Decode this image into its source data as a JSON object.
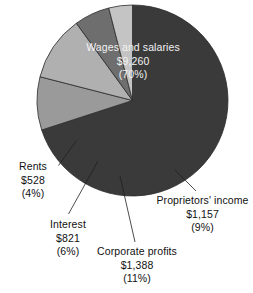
{
  "chart_data": {
    "type": "pie",
    "title": "",
    "subtitle": "",
    "xlabel": "",
    "ylabel": "",
    "legend_position": "none",
    "grid": false,
    "start_angle_deg": 0,
    "direction": "clockwise",
    "units": "billions of dollars",
    "categories": [
      "Wages and salaries",
      "Proprietors' income",
      "Corporate profits",
      "Interest",
      "Rents"
    ],
    "values": [
      9260,
      1157,
      1388,
      821,
      528
    ],
    "percentages": [
      70,
      9,
      11,
      6,
      4
    ],
    "value_labels": [
      "$9,260",
      "$1,157",
      "$1,388",
      "$821",
      "$528"
    ],
    "percent_labels": [
      "(70%)",
      "(9%)",
      "(11%)",
      "(6%)",
      "(4%)"
    ],
    "colors": [
      "#3a3a3a",
      "#9a9a9a",
      "#b0b0b0",
      "#6e6e6e",
      "#c4c4c4"
    ],
    "slices": [
      {
        "name": "Wages and salaries",
        "value": 9260,
        "value_label": "$9,260",
        "percent": 70,
        "percent_label": "(70%)",
        "color": "#3a3a3a",
        "label_placement": "inside"
      },
      {
        "name": "Proprietors' income",
        "value": 1157,
        "value_label": "$1,157",
        "percent": 9,
        "percent_label": "(9%)",
        "color": "#9a9a9a",
        "label_placement": "outside"
      },
      {
        "name": "Corporate profits",
        "value": 1388,
        "value_label": "$1,388",
        "percent": 11,
        "percent_label": "(11%)",
        "color": "#b0b0b0",
        "label_placement": "outside"
      },
      {
        "name": "Interest",
        "value": 821,
        "value_label": "$821",
        "percent": 6,
        "percent_label": "(6%)",
        "color": "#6e6e6e",
        "label_placement": "outside"
      },
      {
        "name": "Rents",
        "value": 528,
        "value_label": "$528",
        "percent": 4,
        "percent_label": "(4%)",
        "color": "#c4c4c4",
        "label_placement": "outside"
      }
    ]
  },
  "style": {
    "background": "#ffffff",
    "slice_outline": "#2b2b2b",
    "leader_line": "#1f1f1f",
    "inside_label_color": "#f2f2f2",
    "outside_label_color": "#111111"
  }
}
